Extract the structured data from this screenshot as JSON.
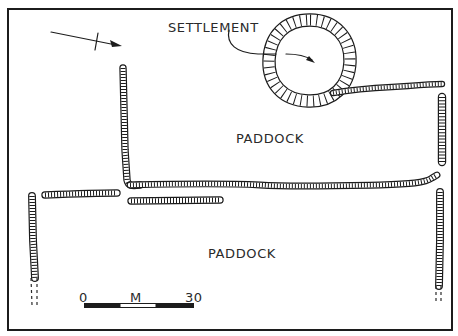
{
  "labels": {
    "settlement": "SETTLEMENT",
    "paddock_upper": "PADDOCK",
    "paddock_lower": "PADDOCK"
  },
  "scale_bar": {
    "start_label": "0",
    "unit_label": "M",
    "end_label": "30",
    "segments": [
      "filled",
      "open",
      "filled"
    ]
  },
  "north_arrow": {
    "icon": "north-arrow-icon"
  },
  "features": [
    {
      "id": "settlement-ring",
      "type": "enclosure"
    },
    {
      "id": "wall-ne-spur",
      "type": "stone-wall"
    },
    {
      "id": "wall-east-upper",
      "type": "stone-wall"
    },
    {
      "id": "wall-vertical-central",
      "type": "stone-wall"
    },
    {
      "id": "wall-long-horizontal",
      "type": "stone-wall"
    },
    {
      "id": "wall-short-horizontal-west",
      "type": "stone-wall"
    },
    {
      "id": "wall-short-horizontal-central",
      "type": "stone-wall"
    },
    {
      "id": "wall-west-vertical",
      "type": "stone-wall",
      "continues": "dashed"
    },
    {
      "id": "wall-east-lower",
      "type": "stone-wall",
      "continues": "dashed"
    }
  ],
  "colors": {
    "ink": "#1c1c1c",
    "paper": "#ffffff"
  }
}
